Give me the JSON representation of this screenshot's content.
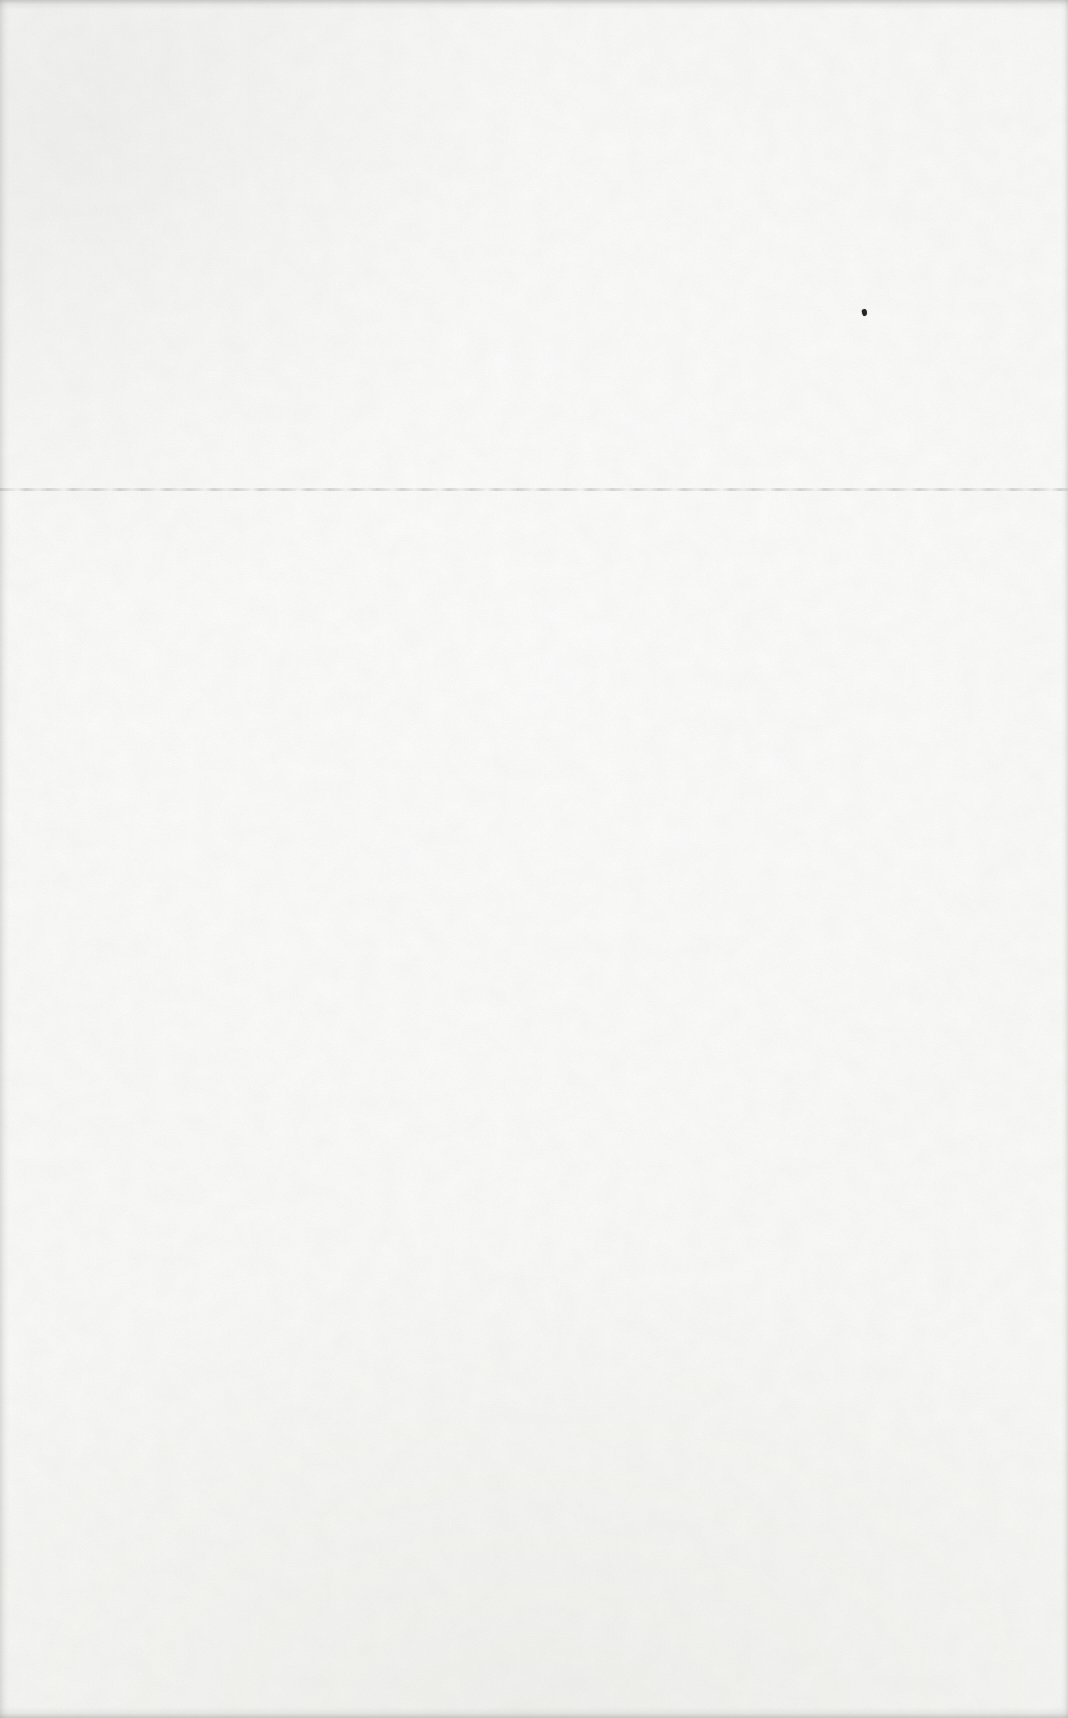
{
  "document": {
    "kind": "scanned-blank-page",
    "visible_text": "",
    "page_number_shown": ""
  },
  "page": {
    "background_color": "#fcfcfb",
    "texture": "paper-grain",
    "edge_shadow_color": "rgba(150,150,147,0.45)",
    "edge_shadow_color_soft": "rgba(160,160,157,0.32)"
  },
  "artifacts": {
    "horizontal_rule": {
      "y_percent": 28.4,
      "color": "rgba(150,150,148,0.38)",
      "spans_full_width": true
    },
    "ink_speck": {
      "x_percent": 80.7,
      "y_percent": 18.0,
      "color": "#262626"
    }
  }
}
